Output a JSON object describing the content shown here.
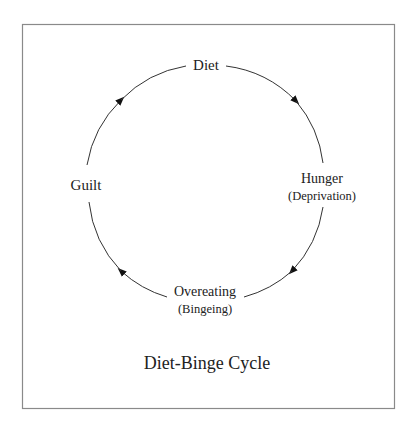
{
  "title": "Diet-Binge Cycle",
  "colors": {
    "line": "#333333",
    "frame": "#8a8a8a",
    "text": "#222222",
    "background": "#ffffff"
  },
  "nodes": [
    {
      "id": "diet",
      "label": "Diet",
      "sublabel": ""
    },
    {
      "id": "hunger",
      "label": "Hunger",
      "sublabel": "(Deprivation)"
    },
    {
      "id": "overeating",
      "label": "Overeating",
      "sublabel": "(Bingeing)"
    },
    {
      "id": "guilt",
      "label": "Guilt",
      "sublabel": ""
    }
  ],
  "edges": [
    {
      "from": "diet",
      "to": "hunger"
    },
    {
      "from": "hunger",
      "to": "overeating"
    },
    {
      "from": "overeating",
      "to": "guilt"
    },
    {
      "from": "guilt",
      "to": "diet"
    }
  ],
  "direction": "clockwise"
}
